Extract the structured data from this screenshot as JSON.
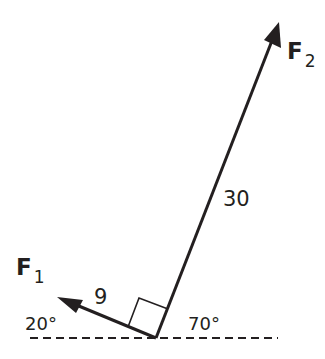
{
  "diagram": {
    "type": "force-vector-diagram",
    "colors": {
      "ink": "#231f20",
      "background": "#ffffff"
    },
    "forces": [
      {
        "name": "F",
        "subscript": "1",
        "magnitude_label": "9",
        "angle_label": "20°",
        "direction": "up-left"
      },
      {
        "name": "F",
        "subscript": "2",
        "magnitude_label": "30",
        "angle_label": "70°",
        "direction": "up-right"
      }
    ],
    "right_angle_marker": true,
    "baseline": "dashed horizontal"
  }
}
